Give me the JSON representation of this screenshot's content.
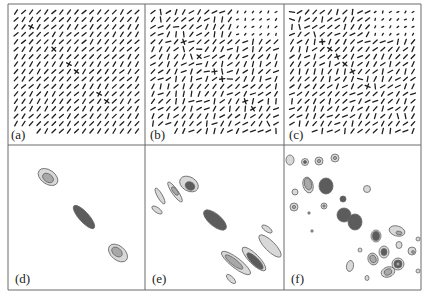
{
  "figure": {
    "frame": {
      "left": 8,
      "top": 4,
      "right": 421,
      "bottom": 290,
      "col_dividers": [
        145,
        284
      ],
      "row_divider": 145
    },
    "colors": {
      "border": "#6a6a6a",
      "tick": "#1e1e1e",
      "light": "#d8d8d8",
      "mid": "#a8a8a8",
      "dark": "#5c5c5c",
      "outline": "#666666"
    },
    "panels": [
      {
        "id": "a",
        "label": "(a)",
        "type": "vector-field",
        "x": 8,
        "y": 4,
        "w": 137,
        "h": 141
      },
      {
        "id": "b",
        "label": "(b)",
        "type": "vector-field",
        "x": 145,
        "y": 4,
        "w": 139,
        "h": 141
      },
      {
        "id": "c",
        "label": "(c)",
        "type": "vector-field",
        "x": 284,
        "y": 4,
        "w": 137,
        "h": 141
      },
      {
        "id": "d",
        "label": "(d)",
        "type": "contour-map",
        "x": 8,
        "y": 145,
        "w": 137,
        "h": 145
      },
      {
        "id": "e",
        "label": "(e)",
        "type": "contour-map",
        "x": 145,
        "y": 145,
        "w": 139,
        "h": 145
      },
      {
        "id": "f",
        "label": "(f)",
        "type": "contour-map",
        "x": 284,
        "y": 145,
        "w": 137,
        "h": 145
      }
    ],
    "contours": {
      "d": [
        {
          "cx": 40,
          "cy": 32,
          "rx": 11,
          "ry": 7,
          "rot": 35,
          "fill": "light"
        },
        {
          "cx": 40,
          "cy": 33,
          "rx": 6,
          "ry": 4,
          "rot": 35,
          "fill": "mid"
        },
        {
          "cx": 76,
          "cy": 72,
          "rx": 15,
          "ry": 5,
          "rot": 48,
          "fill": "dark"
        },
        {
          "cx": 110,
          "cy": 108,
          "rx": 11,
          "ry": 7,
          "rot": 40,
          "fill": "light"
        },
        {
          "cx": 109,
          "cy": 107,
          "rx": 6,
          "ry": 4,
          "rot": 40,
          "fill": "mid"
        }
      ],
      "e": [
        {
          "cx": 44,
          "cy": 39,
          "rx": 10,
          "ry": 7,
          "rot": 30,
          "fill": "light"
        },
        {
          "cx": 45,
          "cy": 41,
          "rx": 5,
          "ry": 4,
          "rot": 30,
          "fill": "dark"
        },
        {
          "cx": 30,
          "cy": 47,
          "rx": 12,
          "ry": 3,
          "rot": 55,
          "fill": "light"
        },
        {
          "cx": 30,
          "cy": 46,
          "rx": 5,
          "ry": 2,
          "rot": 55,
          "fill": "mid"
        },
        {
          "cx": 15,
          "cy": 51,
          "rx": 9,
          "ry": 2.5,
          "rot": 60,
          "fill": "light"
        },
        {
          "cx": 12,
          "cy": 65,
          "rx": 6,
          "ry": 2.5,
          "rot": 35,
          "fill": "light"
        },
        {
          "cx": 70,
          "cy": 75,
          "rx": 14,
          "ry": 6,
          "rot": 40,
          "fill": "dark"
        },
        {
          "cx": 122,
          "cy": 84,
          "rx": 6,
          "ry": 2.5,
          "rot": 35,
          "fill": "light"
        },
        {
          "cx": 125,
          "cy": 101,
          "rx": 15,
          "ry": 5,
          "rot": 45,
          "fill": "light"
        },
        {
          "cx": 109,
          "cy": 114,
          "rx": 16,
          "ry": 5,
          "rot": 45,
          "fill": "light"
        },
        {
          "cx": 110,
          "cy": 116,
          "rx": 11,
          "ry": 3.5,
          "rot": 45,
          "fill": "dark"
        },
        {
          "cx": 91,
          "cy": 118,
          "rx": 18,
          "ry": 5,
          "rot": 38,
          "fill": "light"
        },
        {
          "cx": 89,
          "cy": 117,
          "rx": 11,
          "ry": 3,
          "rot": 38,
          "fill": "mid"
        },
        {
          "cx": 86,
          "cy": 134,
          "rx": 6,
          "ry": 2.5,
          "rot": 45,
          "fill": "light"
        }
      ],
      "f": [
        {
          "cx": 6,
          "cy": 15,
          "rx": 4,
          "ry": 5,
          "rot": 0,
          "fill": "light"
        },
        {
          "cx": 21,
          "cy": 17,
          "rx": 3.5,
          "ry": 3.5,
          "rot": 0,
          "fill": "light"
        },
        {
          "cx": 21,
          "cy": 17,
          "rx": 1.5,
          "ry": 1.5,
          "rot": 0,
          "fill": "dark"
        },
        {
          "cx": 35,
          "cy": 16,
          "rx": 4,
          "ry": 4,
          "rot": 0,
          "fill": "light"
        },
        {
          "cx": 35,
          "cy": 16,
          "rx": 1.6,
          "ry": 1.6,
          "rot": 0,
          "fill": "mid"
        },
        {
          "cx": 51,
          "cy": 13,
          "rx": 4,
          "ry": 4,
          "rot": 0,
          "fill": "light"
        },
        {
          "cx": 51,
          "cy": 13,
          "rx": 1.6,
          "ry": 1.6,
          "rot": 0,
          "fill": "mid"
        },
        {
          "cx": 24,
          "cy": 40,
          "rx": 5,
          "ry": 8,
          "rot": -15,
          "fill": "light"
        },
        {
          "cx": 24,
          "cy": 39,
          "rx": 3.5,
          "ry": 6,
          "rot": -15,
          "fill": "mid"
        },
        {
          "cx": 42,
          "cy": 41,
          "rx": 7,
          "ry": 8,
          "rot": 0,
          "fill": "dark"
        },
        {
          "cx": 11,
          "cy": 47,
          "rx": 3,
          "ry": 3,
          "rot": 0,
          "fill": "light"
        },
        {
          "cx": 83,
          "cy": 44,
          "rx": 3.5,
          "ry": 3.5,
          "rot": 0,
          "fill": "light"
        },
        {
          "cx": 10,
          "cy": 62,
          "rx": 4,
          "ry": 4,
          "rot": 0,
          "fill": "light"
        },
        {
          "cx": 10,
          "cy": 62,
          "rx": 1.6,
          "ry": 1.6,
          "rot": 0,
          "fill": "mid"
        },
        {
          "cx": 40,
          "cy": 61,
          "rx": 3,
          "ry": 3,
          "rot": 0,
          "fill": "light"
        },
        {
          "cx": 40,
          "cy": 61,
          "rx": 1.2,
          "ry": 1.2,
          "rot": 0,
          "fill": "mid"
        },
        {
          "cx": 59,
          "cy": 54,
          "rx": 3,
          "ry": 3,
          "rot": 0,
          "fill": "dark"
        },
        {
          "cx": 25,
          "cy": 68,
          "rx": 1.2,
          "ry": 1.2,
          "rot": 0,
          "fill": "mid"
        },
        {
          "cx": 60,
          "cy": 70,
          "rx": 7,
          "ry": 7,
          "rot": 0,
          "fill": "dark"
        },
        {
          "cx": 71,
          "cy": 77,
          "rx": 7,
          "ry": 8,
          "rot": 0,
          "fill": "dark"
        },
        {
          "cx": 28,
          "cy": 86,
          "rx": 1.2,
          "ry": 1.2,
          "rot": 0,
          "fill": "mid"
        },
        {
          "cx": 92,
          "cy": 91,
          "rx": 5,
          "ry": 6,
          "rot": 0,
          "fill": "light"
        },
        {
          "cx": 92,
          "cy": 91,
          "rx": 3.5,
          "ry": 4.5,
          "rot": 0,
          "fill": "dark"
        },
        {
          "cx": 113,
          "cy": 86,
          "rx": 8,
          "ry": 5,
          "rot": 15,
          "fill": "light"
        },
        {
          "cx": 115,
          "cy": 88,
          "rx": 3,
          "ry": 1.8,
          "rot": 10,
          "fill": "mid"
        },
        {
          "cx": 134,
          "cy": 94,
          "rx": 2,
          "ry": 2,
          "rot": 0,
          "fill": "light"
        },
        {
          "cx": 115,
          "cy": 100,
          "rx": 3,
          "ry": 3.5,
          "rot": 0,
          "fill": "light"
        },
        {
          "cx": 100,
          "cy": 107,
          "rx": 5,
          "ry": 6,
          "rot": 0,
          "fill": "light"
        },
        {
          "cx": 100,
          "cy": 107,
          "rx": 3,
          "ry": 3.5,
          "rot": 0,
          "fill": "dark"
        },
        {
          "cx": 128,
          "cy": 106,
          "rx": 4,
          "ry": 4,
          "rot": 0,
          "fill": "light"
        },
        {
          "cx": 129,
          "cy": 107,
          "rx": 1.4,
          "ry": 1.4,
          "rot": 0,
          "fill": "mid"
        },
        {
          "cx": 76,
          "cy": 105,
          "rx": 2,
          "ry": 2,
          "rot": 0,
          "fill": "light"
        },
        {
          "cx": 89,
          "cy": 114,
          "rx": 5,
          "ry": 6,
          "rot": -20,
          "fill": "light"
        },
        {
          "cx": 89,
          "cy": 114,
          "rx": 3,
          "ry": 4,
          "rot": -20,
          "fill": "mid"
        },
        {
          "cx": 114,
          "cy": 119,
          "rx": 6,
          "ry": 6,
          "rot": 0,
          "fill": "light"
        },
        {
          "cx": 114,
          "cy": 119,
          "rx": 4,
          "ry": 4,
          "rot": 0,
          "fill": "dark"
        },
        {
          "cx": 114,
          "cy": 119,
          "rx": 1.8,
          "ry": 1.8,
          "rot": 0,
          "fill": "mid"
        },
        {
          "cx": 66,
          "cy": 121,
          "rx": 3.5,
          "ry": 5.5,
          "rot": 10,
          "fill": "light"
        },
        {
          "cx": 104,
          "cy": 127,
          "rx": 7,
          "ry": 5,
          "rot": -20,
          "fill": "light"
        },
        {
          "cx": 104,
          "cy": 127,
          "rx": 4,
          "ry": 3,
          "rot": -20,
          "fill": "mid"
        },
        {
          "cx": 83,
          "cy": 133,
          "rx": 2,
          "ry": 2.5,
          "rot": 0,
          "fill": "light"
        },
        {
          "cx": 134,
          "cy": 126,
          "rx": 2,
          "ry": 2,
          "rot": 0,
          "fill": "light"
        }
      ]
    },
    "vector_field": {
      "grid": 17,
      "margin": 8,
      "seeds": {
        "a": 3,
        "b": 11,
        "c": 23
      },
      "diagonal_crosses": {
        "a": 9,
        "b": 4,
        "c": 5
      }
    }
  }
}
